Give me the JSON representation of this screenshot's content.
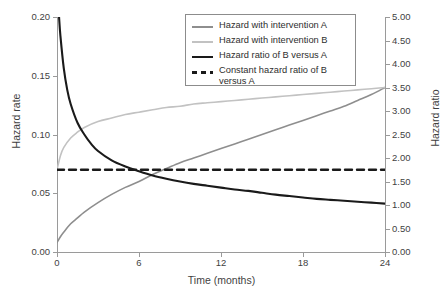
{
  "chart_data": {
    "type": "line",
    "title": "",
    "xlabel": "Time (months)",
    "ylabel": "Hazard rate",
    "ylabel_right": "Hazard ratio",
    "xlim": [
      0,
      24
    ],
    "ylim": [
      0.0,
      0.2
    ],
    "ylim_right": [
      0.0,
      5.0
    ],
    "grid": false,
    "legend_position": "top-center",
    "xticks": [
      "0",
      "6",
      "12",
      "18",
      "24"
    ],
    "xtick_values": [
      0,
      6,
      12,
      18,
      24
    ],
    "yticks_left": [
      "0.00",
      "0.05",
      "0.10",
      "0.15",
      "0.20"
    ],
    "ytick_values_left": [
      0.0,
      0.05,
      0.1,
      0.15,
      0.2
    ],
    "yticks_right": [
      "0.00",
      "0.50",
      "1.00",
      "1.50",
      "2.00",
      "2.50",
      "3.00",
      "3.50",
      "4.00",
      "4.50",
      "5.00"
    ],
    "ytick_values_right": [
      0.0,
      0.5,
      1.0,
      1.5,
      2.0,
      2.5,
      3.0,
      3.5,
      4.0,
      4.5,
      5.0
    ],
    "series": [
      {
        "name": "Hazard with intervention A",
        "axis": "left",
        "color": "#8e8e8e",
        "width": 1.6,
        "dash": "none",
        "x": [
          0,
          0.25,
          0.5,
          1,
          1.5,
          2,
          3,
          4,
          5,
          6,
          7,
          8,
          9,
          10,
          11,
          12,
          13,
          14,
          15,
          16,
          17,
          18,
          19,
          20,
          21,
          22,
          23,
          24
        ],
        "y": [
          0.008,
          0.013,
          0.017,
          0.024,
          0.029,
          0.034,
          0.042,
          0.049,
          0.055,
          0.06,
          0.066,
          0.071,
          0.076,
          0.08,
          0.084,
          0.088,
          0.092,
          0.096,
          0.1,
          0.104,
          0.108,
          0.112,
          0.116,
          0.12,
          0.124,
          0.129,
          0.134,
          0.14
        ]
      },
      {
        "name": "Hazard with intervention B",
        "axis": "left",
        "color": "#c2c2c2",
        "width": 1.6,
        "dash": "none",
        "x": [
          0,
          0.25,
          0.5,
          1,
          1.5,
          2,
          3,
          4,
          5,
          6,
          7,
          8,
          9,
          10,
          11,
          12,
          13,
          14,
          15,
          16,
          17,
          18,
          19,
          20,
          21,
          22,
          23,
          24
        ],
        "y": [
          0.07,
          0.082,
          0.089,
          0.097,
          0.102,
          0.106,
          0.111,
          0.114,
          0.117,
          0.119,
          0.121,
          0.123,
          0.124,
          0.126,
          0.127,
          0.128,
          0.129,
          0.13,
          0.131,
          0.132,
          0.133,
          0.134,
          0.135,
          0.136,
          0.137,
          0.138,
          0.139,
          0.14
        ]
      },
      {
        "name": "Hazard ratio of B versus A",
        "axis": "right",
        "color": "#1a1a1a",
        "width": 2.1,
        "dash": "none",
        "x": [
          0.15,
          0.25,
          0.5,
          0.75,
          1,
          1.5,
          2,
          2.5,
          3,
          4,
          5,
          6,
          7,
          8,
          9,
          10,
          11,
          12,
          13,
          14,
          15,
          16,
          17,
          18,
          19,
          20,
          21,
          22,
          23,
          24
        ],
        "y": [
          5.0,
          4.6,
          3.9,
          3.45,
          3.15,
          2.75,
          2.5,
          2.3,
          2.15,
          1.95,
          1.82,
          1.72,
          1.63,
          1.56,
          1.5,
          1.45,
          1.41,
          1.37,
          1.33,
          1.3,
          1.26,
          1.22,
          1.19,
          1.16,
          1.13,
          1.11,
          1.09,
          1.07,
          1.05,
          1.03
        ]
      },
      {
        "name": "Constant hazard ratio of B versus A",
        "axis": "right",
        "color": "#1a1a1a",
        "width": 2.4,
        "dash": "7 5",
        "x": [
          0,
          24
        ],
        "y": [
          1.75,
          1.75
        ]
      }
    ]
  },
  "legend": {
    "items": [
      {
        "label": "Hazard with intervention A",
        "color": "#8e8e8e",
        "width": 1.6,
        "dash": "none"
      },
      {
        "label": "Hazard with intervention B",
        "color": "#c2c2c2",
        "width": 1.6,
        "dash": "none"
      },
      {
        "label": "Hazard ratio of B versus A",
        "color": "#1a1a1a",
        "width": 2.2,
        "dash": "none"
      },
      {
        "label": "Constant hazard ratio of B versus A",
        "color": "#1a1a1a",
        "width": 2.6,
        "dash": "5 4"
      }
    ]
  },
  "caption": ""
}
